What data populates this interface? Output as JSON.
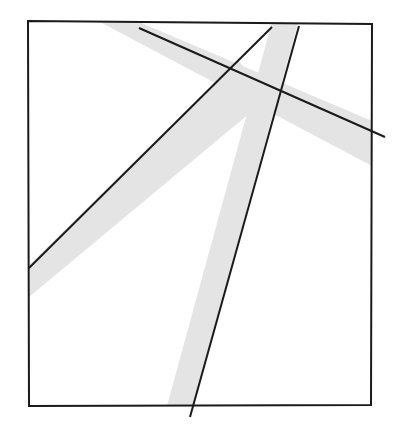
{
  "figure": {
    "kind": "line-diagram",
    "canvas": {
      "width": 393,
      "height": 425
    },
    "background_color": "#ffffff",
    "band_fill_color": "#e4e4e4",
    "band_edge_color": "#e4e4e4",
    "line_color": "#1a1a1a",
    "frame": {
      "name": "outer-frame",
      "stroke_color": "#1a1a1a",
      "stroke_width": 2,
      "fill": "none",
      "corners": {
        "top_left": [
          28,
          21
        ],
        "top_right": [
          372,
          24
        ],
        "bottom_right": [
          371,
          405
        ],
        "bottom_left": [
          29,
          406
        ]
      },
      "points": "28,21 372,24 371,405 29,406"
    },
    "bands": [
      {
        "name": "band-northeast",
        "description": "light gray corridor running from upper-left top edge down-right to the right edge",
        "polygon": "100,22 139,22 372,121 372,166",
        "fill": "#e4e4e4"
      },
      {
        "name": "band-southwest",
        "description": "light gray corridor running from the junction down-left to the left edge",
        "polygon": "238,60 268,98 29,297 29,265",
        "fill": "#e4e4e4"
      },
      {
        "name": "band-south",
        "description": "light gray corridor running from the top edge down through the junction to the bottom edge",
        "polygon": "272,22 298,23 193,406 167,406",
        "fill": "#e4e4e4"
      }
    ],
    "lines": [
      {
        "name": "line-upper-left-to-right-edge",
        "description": "long black line from the top edge near upper-left to the right edge",
        "x1": 139,
        "y1": 28,
        "x2": 385,
        "y2": 137,
        "stroke_width": 2
      },
      {
        "name": "line-junction-to-left-edge",
        "description": "black line from the junction down-left to the left border",
        "x1": 272,
        "y1": 27,
        "x2": 29,
        "y2": 268,
        "stroke_width": 2
      },
      {
        "name": "line-top-to-bottom",
        "description": "black line from the top edge running down, exiting below the bottom border",
        "x1": 299,
        "y1": 26,
        "x2": 190,
        "y2": 417,
        "stroke_width": 2
      }
    ]
  }
}
